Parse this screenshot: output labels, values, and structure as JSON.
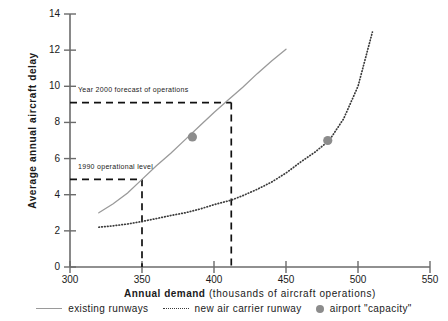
{
  "chart_data": {
    "type": "line",
    "title": "",
    "xlabel_bold": "Annual demand",
    "xlabel_rest": "(thousands of aircraft operations)",
    "ylabel": "Average annual aircraft delay",
    "xlim": [
      300,
      550
    ],
    "ylim": [
      0,
      14
    ],
    "xticks": [
      300,
      350,
      400,
      450,
      500,
      550
    ],
    "yticks": [
      0,
      2,
      4,
      6,
      8,
      10,
      12,
      14
    ],
    "grid": false,
    "legend_position": "bottom",
    "series": [
      {
        "name": "existing runways",
        "style": "solid",
        "color": "#9a9a9a",
        "x": [
          320,
          330,
          340,
          350,
          360,
          370,
          380,
          390,
          400,
          410,
          420,
          430,
          440,
          450
        ],
        "y": [
          3.0,
          3.5,
          4.1,
          4.85,
          5.6,
          6.3,
          7.05,
          7.8,
          8.55,
          9.25,
          9.95,
          10.7,
          11.4,
          12.05
        ]
      },
      {
        "name": "new air carrier runway",
        "style": "dotted",
        "color": "#3a3a3a",
        "x": [
          320,
          330,
          340,
          350,
          360,
          370,
          380,
          390,
          400,
          412,
          420,
          430,
          440,
          450,
          460,
          470,
          480,
          490,
          500,
          510
        ],
        "y": [
          2.2,
          2.28,
          2.38,
          2.52,
          2.68,
          2.85,
          3.0,
          3.2,
          3.45,
          3.7,
          3.95,
          4.3,
          4.7,
          5.2,
          5.8,
          6.35,
          7.0,
          8.2,
          10.0,
          13.0
        ]
      }
    ],
    "markers": [
      {
        "label": "airport \"capacity\"",
        "x": 385,
        "y": 7.2,
        "series": "existing runways",
        "color": "#8c8c8c"
      },
      {
        "label": "airport \"capacity\"",
        "x": 479,
        "y": 7.0,
        "series": "new air carrier runway",
        "color": "#8c8c8c"
      }
    ],
    "reference_lines": [
      {
        "label": "Year 2000 forecast of operations",
        "y": 9.1,
        "x": 412,
        "style": "dashed"
      },
      {
        "label": "1990 operational level",
        "y": 4.85,
        "x": 350,
        "style": "dashed"
      }
    ],
    "legend": [
      {
        "label": "existing runways",
        "marker": "solid-line"
      },
      {
        "label": "new air carrier runway",
        "marker": "dotted-line"
      },
      {
        "label": "airport \"capacity\"",
        "marker": "filled-circle"
      }
    ],
    "annotations": [
      {
        "text": "Year 2000 forecast of operations",
        "x": 412,
        "y": 9.1
      },
      {
        "text": "1990 operational level",
        "x": 350,
        "y": 4.85
      }
    ]
  }
}
